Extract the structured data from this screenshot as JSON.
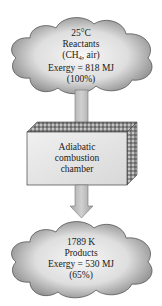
{
  "reactants": {
    "temperature": "25°C",
    "name": "Reactants",
    "composition_prefix": "(CH",
    "composition_sub": "4",
    "composition_suffix": ", air)",
    "exergy": "Exergy = 818 MJ",
    "percent": "(100%)"
  },
  "chamber": {
    "line1": "Adiabatic",
    "line2": "combustion",
    "line3": "chamber"
  },
  "products": {
    "temperature": "1789 K",
    "name": "Products",
    "exergy": "Exergy = 530 MJ",
    "percent": "(65%)"
  },
  "colors": {
    "cloud_fill_center": "#f4f4f4",
    "cloud_fill_edge": "#8a8a8a",
    "arrow_fill": "#b8b8b8",
    "box_front": "#e6e6e6",
    "box_texture": "#555555"
  }
}
